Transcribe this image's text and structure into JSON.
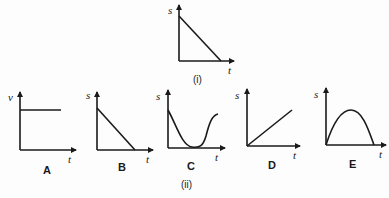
{
  "figure": {
    "part_i": {
      "caption": "(i)",
      "graph": {
        "y_label": "s",
        "x_label": "t",
        "shape": "straight line decreasing from s-axis to t-axis"
      }
    },
    "part_ii": {
      "caption": "(ii)",
      "graphs": [
        {
          "letter": "A",
          "y_label": "v",
          "x_label": "t",
          "shape": "horizontal line (constant velocity)"
        },
        {
          "letter": "B",
          "y_label": "s",
          "x_label": "t",
          "shape": "straight line decreasing to zero"
        },
        {
          "letter": "C",
          "y_label": "s",
          "x_label": "t",
          "shape": "decreasing curve to minimum then rising"
        },
        {
          "letter": "D",
          "y_label": "s",
          "x_label": "t",
          "shape": "straight line increasing from origin"
        },
        {
          "letter": "E",
          "y_label": "s",
          "x_label": "t",
          "shape": "arch rising from origin to peak then falling to t-axis"
        }
      ]
    }
  },
  "colors": {
    "ink": "#1a1a1a",
    "background": "#fdfdfd"
  }
}
